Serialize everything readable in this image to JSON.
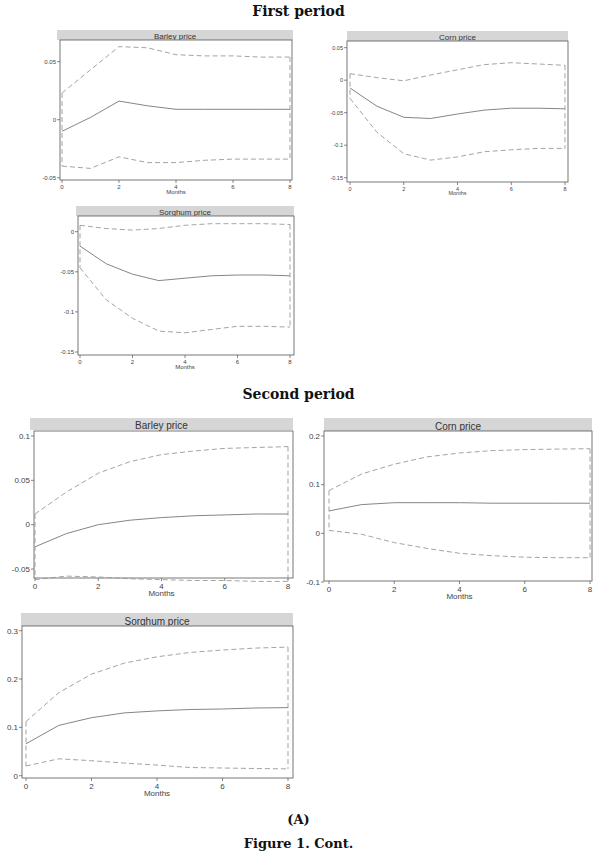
{
  "sections": [
    {
      "title": "First period"
    },
    {
      "title": "Second period"
    }
  ],
  "caption": {
    "label": "(A)",
    "figure": "Figure 1. Cont."
  },
  "chart_data": [
    {
      "type": "line",
      "period": "First period",
      "title": "Barley price",
      "xlabel": "Months",
      "ylabel": "",
      "x": [
        0,
        1,
        2,
        3,
        4,
        5,
        6,
        7,
        8
      ],
      "xticks": [
        0,
        2,
        4,
        6,
        8
      ],
      "yticks": [
        -0.05,
        0,
        0.05
      ],
      "ytick_labels": [
        "-0.05",
        "0",
        "0.05"
      ],
      "ylim": [
        -0.055,
        0.07
      ],
      "series": [
        {
          "name": "IRF",
          "style": "solid",
          "values": [
            -0.01,
            0.002,
            0.016,
            0.012,
            0.009,
            0.009,
            0.009,
            0.009,
            0.009
          ]
        },
        {
          "name": "Upper CI",
          "style": "dashed",
          "values": [
            0.023,
            0.043,
            0.063,
            0.062,
            0.056,
            0.055,
            0.055,
            0.054,
            0.054
          ]
        },
        {
          "name": "Lower CI",
          "style": "dashed",
          "values": [
            -0.04,
            -0.042,
            -0.032,
            -0.037,
            -0.037,
            -0.035,
            -0.034,
            -0.034,
            -0.034
          ]
        }
      ]
    },
    {
      "type": "line",
      "period": "First period",
      "title": "Corn price",
      "xlabel": "Months",
      "ylabel": "",
      "x": [
        0,
        1,
        2,
        3,
        4,
        5,
        6,
        7,
        8
      ],
      "xticks": [
        0,
        2,
        4,
        6,
        8
      ],
      "yticks": [
        -0.15,
        -0.1,
        -0.05,
        0,
        0.05
      ],
      "ytick_labels": [
        "-0.15",
        "-0.1",
        "-0.05",
        "0",
        "0.05"
      ],
      "ylim": [
        -0.155,
        0.06
      ],
      "series": [
        {
          "name": "IRF",
          "style": "solid",
          "values": [
            -0.012,
            -0.04,
            -0.057,
            -0.059,
            -0.052,
            -0.046,
            -0.043,
            -0.043,
            -0.044
          ]
        },
        {
          "name": "Upper CI",
          "style": "dashed",
          "values": [
            0.01,
            0.004,
            -0.001,
            0.008,
            0.016,
            0.024,
            0.027,
            0.025,
            0.023
          ]
        },
        {
          "name": "Lower CI",
          "style": "dashed",
          "values": [
            -0.028,
            -0.08,
            -0.113,
            -0.123,
            -0.118,
            -0.11,
            -0.107,
            -0.105,
            -0.105
          ]
        }
      ]
    },
    {
      "type": "line",
      "period": "First period",
      "title": "Sorghum price",
      "xlabel": "Months",
      "ylabel": "",
      "x": [
        0,
        1,
        2,
        3,
        4,
        5,
        6,
        7,
        8
      ],
      "xticks": [
        0,
        2,
        4,
        6,
        8
      ],
      "yticks": [
        -0.15,
        -0.1,
        -0.05,
        0,
        0.05
      ],
      "ytick_labels": [
        "-0.15",
        "-0.1",
        "-0.05",
        "0"
      ],
      "ylim": [
        -0.155,
        0.015
      ],
      "series": [
        {
          "name": "IRF",
          "style": "solid",
          "values": [
            -0.018,
            -0.04,
            -0.053,
            -0.061,
            -0.058,
            -0.055,
            -0.054,
            -0.054,
            -0.055
          ]
        },
        {
          "name": "Upper CI",
          "style": "dashed",
          "values": [
            0.008,
            0.004,
            0.002,
            0.004,
            0.008,
            0.01,
            0.01,
            0.01,
            0.009
          ]
        },
        {
          "name": "Lower CI",
          "style": "dashed",
          "values": [
            -0.045,
            -0.085,
            -0.108,
            -0.124,
            -0.126,
            -0.122,
            -0.118,
            -0.118,
            -0.119
          ]
        }
      ]
    },
    {
      "type": "line",
      "period": "Second period",
      "title": "Barley price",
      "xlabel": "Months",
      "ylabel": "",
      "x": [
        0,
        1,
        2,
        3,
        4,
        5,
        6,
        7,
        8
      ],
      "xticks": [
        0,
        2,
        4,
        6,
        8
      ],
      "yticks": [
        -0.05,
        0,
        0.05,
        0.1
      ],
      "ytick_labels": [
        "-0.05",
        "0",
        "0.05",
        "0.1"
      ],
      "ylim": [
        -0.07,
        0.105
      ],
      "series": [
        {
          "name": "IRF",
          "style": "solid",
          "values": [
            -0.025,
            -0.01,
            0.0,
            0.005,
            0.008,
            0.01,
            0.011,
            0.012,
            0.012
          ]
        },
        {
          "name": "Upper CI",
          "style": "dashed",
          "values": [
            0.012,
            0.037,
            0.058,
            0.071,
            0.079,
            0.083,
            0.086,
            0.087,
            0.088
          ]
        },
        {
          "name": "Lower CI",
          "style": "dashed",
          "values": [
            -0.062,
            -0.058,
            -0.059,
            -0.061,
            -0.062,
            -0.063,
            -0.063,
            -0.064,
            -0.064
          ]
        }
      ]
    },
    {
      "type": "line",
      "period": "Second period",
      "title": "Corn price",
      "xlabel": "Months",
      "ylabel": "",
      "x": [
        0,
        1,
        2,
        3,
        4,
        5,
        6,
        7,
        8
      ],
      "xticks": [
        0,
        2,
        4,
        6,
        8
      ],
      "yticks": [
        -0.1,
        0,
        0.1,
        0.2
      ],
      "ytick_labels": [
        "-0.1",
        "0",
        "0.1",
        "0.2"
      ],
      "ylim": [
        -0.105,
        0.205
      ],
      "series": [
        {
          "name": "IRF",
          "style": "solid",
          "values": [
            0.046,
            0.059,
            0.063,
            0.063,
            0.063,
            0.062,
            0.062,
            0.062,
            0.062
          ]
        },
        {
          "name": "Upper CI",
          "style": "dashed",
          "values": [
            0.088,
            0.122,
            0.142,
            0.157,
            0.165,
            0.17,
            0.172,
            0.173,
            0.174
          ]
        },
        {
          "name": "Lower CI",
          "style": "dashed",
          "values": [
            0.006,
            -0.002,
            -0.019,
            -0.031,
            -0.041,
            -0.046,
            -0.049,
            -0.05,
            -0.05
          ]
        }
      ]
    },
    {
      "type": "line",
      "period": "Second period",
      "title": "Sorghum price",
      "xlabel": "Months",
      "ylabel": "",
      "x": [
        0,
        1,
        2,
        3,
        4,
        5,
        6,
        7,
        8
      ],
      "xticks": [
        0,
        2,
        4,
        6,
        8
      ],
      "yticks": [
        0,
        0.1,
        0.2,
        0.3
      ],
      "ytick_labels": [
        "0",
        "0.1",
        "0.2",
        "0.3"
      ],
      "ylim": [
        -0.01,
        0.31
      ],
      "series": [
        {
          "name": "IRF",
          "style": "solid",
          "values": [
            0.066,
            0.104,
            0.12,
            0.13,
            0.134,
            0.137,
            0.138,
            0.14,
            0.141
          ]
        },
        {
          "name": "Upper CI",
          "style": "dashed",
          "values": [
            0.112,
            0.172,
            0.21,
            0.233,
            0.246,
            0.255,
            0.26,
            0.264,
            0.266
          ]
        },
        {
          "name": "Lower CI",
          "style": "dashed",
          "values": [
            0.02,
            0.035,
            0.031,
            0.026,
            0.022,
            0.017,
            0.016,
            0.015,
            0.014
          ]
        }
      ]
    }
  ]
}
